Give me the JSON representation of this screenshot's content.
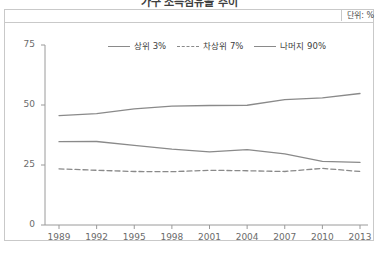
{
  "header": {
    "title": "가구 소득점유율 추이",
    "unit_label": "단위: %"
  },
  "colors": {
    "line": "#8a8a8a",
    "axis": "#9a9a9a",
    "frame": "#c9c9c9",
    "text": "#5a5a5a",
    "background": "#ffffff"
  },
  "legend": {
    "items": [
      {
        "label": "상위 3%",
        "style": "solid"
      },
      {
        "label": "차상위 7%",
        "style": "dashed"
      },
      {
        "label": "나머지 90%",
        "style": "solid"
      }
    ]
  },
  "axes": {
    "y_ticks": [
      "75",
      "50",
      "25",
      "0"
    ],
    "x_ticks": [
      "1989",
      "1992",
      "1995",
      "1998",
      "2001",
      "2004",
      "2007",
      "2010",
      "2013"
    ]
  },
  "chart_data": {
    "type": "line",
    "title": "가구 소득점유율 추이",
    "xlabel": "",
    "ylabel": "",
    "unit": "%",
    "grid": false,
    "legend_position": "top-center",
    "ylim": [
      0,
      75
    ],
    "yticks": [
      0,
      25,
      50,
      75
    ],
    "x": [
      1989,
      1992,
      1995,
      1998,
      2001,
      2004,
      2007,
      2010,
      2013
    ],
    "categories": [
      "1989",
      "1992",
      "1995",
      "1998",
      "2001",
      "2004",
      "2007",
      "2010",
      "2013"
    ],
    "series": [
      {
        "name": "나머지 90%",
        "style": "solid",
        "values": [
          45.6,
          46.4,
          48.4,
          49.5,
          49.8,
          49.9,
          52.2,
          53.0,
          54.8
        ]
      },
      {
        "name": "상위 3%",
        "style": "solid",
        "values": [
          34.7,
          34.8,
          33.2,
          31.6,
          30.5,
          31.4,
          29.6,
          26.5,
          26.1
        ]
      },
      {
        "name": "차상위 7%",
        "style": "dashed",
        "values": [
          23.4,
          22.8,
          22.3,
          22.2,
          22.8,
          22.6,
          22.3,
          23.6,
          22.3
        ]
      }
    ]
  }
}
